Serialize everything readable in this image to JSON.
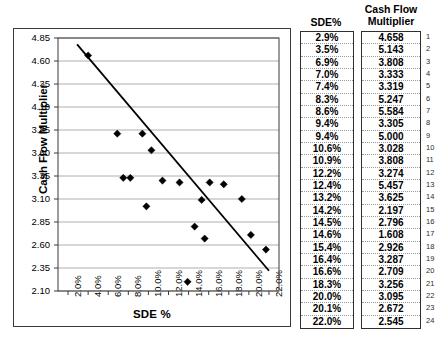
{
  "chart_data": {
    "type": "scatter",
    "title": "",
    "xlabel": "SDE %",
    "ylabel": "Cash Flow Multiplier",
    "xlim": [
      1.0,
      23.0
    ],
    "ylim": [
      2.1,
      4.85
    ],
    "xticks": [
      "2.0%",
      "4.0%",
      "6.0%",
      "8.0%",
      "10.0%",
      "12.0%",
      "14.0%",
      "16.0%",
      "18.0%",
      "20.0%",
      "22.0%"
    ],
    "xtick_values": [
      2.0,
      4.0,
      6.0,
      8.0,
      10.0,
      12.0,
      14.0,
      16.0,
      18.0,
      20.0,
      22.0
    ],
    "yticks": [
      "4.85",
      "4.60",
      "4.35",
      "4.10",
      "3.85",
      "3.60",
      "3.35",
      "3.10",
      "2.85",
      "2.60",
      "2.35",
      "2.10"
    ],
    "ytick_values": [
      4.85,
      4.6,
      4.35,
      4.1,
      3.85,
      3.6,
      3.35,
      3.1,
      2.85,
      2.6,
      2.35,
      2.1
    ],
    "grid": true,
    "legend": false,
    "marker": "diamond",
    "marker_color": "#000000",
    "trendline": {
      "visible": true,
      "color": "#000000",
      "x_start": 2.9,
      "y_start": 4.78,
      "x_end": 22.0,
      "y_end": 2.32
    },
    "x": [
      2.9,
      3.5,
      6.9,
      7.0,
      7.4,
      8.3,
      8.6,
      9.4,
      9.4,
      10.6,
      10.9,
      12.2,
      12.4,
      13.2,
      14.2,
      14.5,
      14.6,
      15.4,
      16.4,
      16.6,
      18.3,
      20.0,
      20.1,
      22.0
    ],
    "y": [
      4.658,
      5.143,
      3.808,
      3.333,
      3.319,
      5.247,
      5.584,
      3.305,
      5.0,
      3.028,
      3.808,
      3.274,
      5.457,
      3.625,
      2.197,
      2.796,
      1.608,
      2.926,
      3.287,
      2.709,
      3.256,
      3.095,
      2.672,
      2.545
    ],
    "points": [
      {
        "n": 1,
        "sde": "2.9%",
        "multiplier": "4.658"
      },
      {
        "n": 2,
        "sde": "3.5%",
        "multiplier": "5.143"
      },
      {
        "n": 3,
        "sde": "6.9%",
        "multiplier": "3.808"
      },
      {
        "n": 4,
        "sde": "7.0%",
        "multiplier": "3.333"
      },
      {
        "n": 5,
        "sde": "7.4%",
        "multiplier": "3.319"
      },
      {
        "n": 6,
        "sde": "8.3%",
        "multiplier": "5.247"
      },
      {
        "n": 7,
        "sde": "8.6%",
        "multiplier": "5.584"
      },
      {
        "n": 8,
        "sde": "9.4%",
        "multiplier": "3.305"
      },
      {
        "n": 9,
        "sde": "9.4%",
        "multiplier": "5.000"
      },
      {
        "n": 10,
        "sde": "10.6%",
        "multiplier": "3.028"
      },
      {
        "n": 11,
        "sde": "10.9%",
        "multiplier": "3.808"
      },
      {
        "n": 12,
        "sde": "12.2%",
        "multiplier": "3.274"
      },
      {
        "n": 13,
        "sde": "12.4%",
        "multiplier": "5.457"
      },
      {
        "n": 14,
        "sde": "13.2%",
        "multiplier": "3.625"
      },
      {
        "n": 15,
        "sde": "14.2%",
        "multiplier": "2.197"
      },
      {
        "n": 16,
        "sde": "14.5%",
        "multiplier": "2.796"
      },
      {
        "n": 17,
        "sde": "14.6%",
        "multiplier": "1.608"
      },
      {
        "n": 18,
        "sde": "15.4%",
        "multiplier": "2.926"
      },
      {
        "n": 19,
        "sde": "16.4%",
        "multiplier": "3.287"
      },
      {
        "n": 20,
        "sde": "16.6%",
        "multiplier": "2.709"
      },
      {
        "n": 21,
        "sde": "18.3%",
        "multiplier": "3.256"
      },
      {
        "n": 22,
        "sde": "20.0%",
        "multiplier": "3.095"
      },
      {
        "n": 23,
        "sde": "20.1%",
        "multiplier": "2.672"
      },
      {
        "n": 24,
        "sde": "22.0%",
        "multiplier": "2.545"
      }
    ],
    "plotted_points": [
      {
        "px": 4.0,
        "py": 4.66
      },
      {
        "px": 9.9,
        "py": 5.02
      },
      {
        "px": 6.9,
        "py": 3.81
      },
      {
        "px": 8.2,
        "py": 3.33
      },
      {
        "px": 7.5,
        "py": 3.33
      },
      {
        "px": 9.4,
        "py": 3.81
      },
      {
        "px": 10.3,
        "py": 3.63
      },
      {
        "px": 11.4,
        "py": 3.3
      },
      {
        "px": 9.8,
        "py": 3.02
      },
      {
        "px": 13.1,
        "py": 3.28
      },
      {
        "px": 13.9,
        "py": 2.2
      },
      {
        "px": 14.6,
        "py": 2.8
      },
      {
        "px": 15.3,
        "py": 3.09
      },
      {
        "px": 16.1,
        "py": 3.28
      },
      {
        "px": 15.6,
        "py": 2.67
      },
      {
        "px": 17.5,
        "py": 3.26
      },
      {
        "px": 19.3,
        "py": 3.1
      },
      {
        "px": 20.2,
        "py": 2.71
      },
      {
        "px": 21.7,
        "py": 2.55
      }
    ]
  },
  "table": {
    "headers": {
      "sde": "SDE%",
      "cash_flow_multiplier_line1": "Cash Flow",
      "cash_flow_multiplier_line2": "Multiplier"
    }
  }
}
